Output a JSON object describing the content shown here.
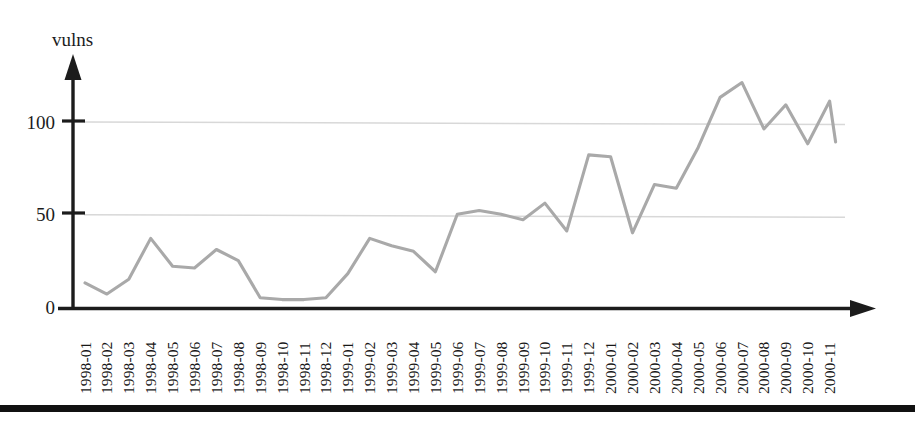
{
  "figure": {
    "background_color": "#ffffff",
    "line_color": "#a9a9a9",
    "grid_color": "#d8d8d8",
    "axis_color": "#1c1c1c",
    "page_rule_color": "#111111"
  },
  "chart_data": {
    "type": "line",
    "title": "",
    "subtitle": "",
    "xlabel": "",
    "ylabel": "vulns",
    "legend": [],
    "legend_position": "none",
    "grid": true,
    "gridlines_y": [
      50,
      100
    ],
    "ylim": [
      0,
      130
    ],
    "yticks": [
      0,
      50,
      100
    ],
    "ytick_labels": [
      "0",
      "50",
      "100"
    ],
    "xlim_labels": [
      "1998-01",
      "2000-11"
    ],
    "categories": [
      "1998-01",
      "1998-02",
      "1998-03",
      "1998-04",
      "1998-05",
      "1998-06",
      "1998-07",
      "1998-08",
      "1998-09",
      "1998-10",
      "1998-11",
      "1998-12",
      "1999-01",
      "1999-02",
      "1999-03",
      "1999-04",
      "1999-05",
      "1999-06",
      "1999-07",
      "1999-08",
      "1999-09",
      "1999-10",
      "1999-11",
      "1999-12",
      "2000-01",
      "2000-02",
      "2000-03",
      "2000-04",
      "2000-05",
      "2000-06",
      "2000-07",
      "2000-08",
      "2000-09",
      "2000-10",
      "2000-11"
    ],
    "values": [
      13,
      7,
      15,
      37,
      22,
      21,
      31,
      25,
      5,
      4,
      4,
      5,
      18,
      37,
      33,
      30,
      19,
      50,
      52,
      50,
      47,
      56,
      41,
      82,
      81,
      40,
      66,
      64,
      86,
      113,
      121,
      96,
      109,
      88,
      111
    ],
    "last_point_value": 89,
    "annotations": []
  },
  "axes": {
    "y_axis_name": "y-axis-arrow",
    "x_axis_name": "x-axis-arrow",
    "y_label": "vulns"
  }
}
